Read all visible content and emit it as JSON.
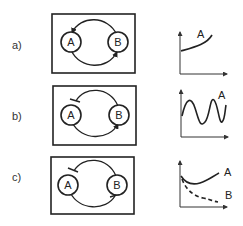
{
  "figure": {
    "rows": [
      {
        "label": "a)",
        "motif": "mutual activation (positive feedback)",
        "nodes": [
          "A",
          "B"
        ],
        "edges": [
          {
            "from": "B",
            "to": "A",
            "type": "activation"
          },
          {
            "from": "A",
            "to": "B",
            "type": "activation"
          }
        ],
        "plot": {
          "curves": [
            {
              "label": "A",
              "shape": "increasing exponential",
              "style": "solid"
            }
          ]
        }
      },
      {
        "label": "b)",
        "motif": "negative feedback loop",
        "nodes": [
          "A",
          "B"
        ],
        "edges": [
          {
            "from": "B",
            "to": "A",
            "type": "inhibition"
          },
          {
            "from": "A",
            "to": "B",
            "type": "activation"
          }
        ],
        "plot": {
          "curves": [
            {
              "label": "A",
              "shape": "oscillation",
              "style": "solid"
            }
          ]
        }
      },
      {
        "label": "c)",
        "motif": "mutual inhibition",
        "nodes": [
          "A",
          "B"
        ],
        "edges": [
          {
            "from": "B",
            "to": "A",
            "type": "inhibition"
          },
          {
            "from": "A",
            "to": "B",
            "type": "inhibition"
          }
        ],
        "plot": {
          "curves": [
            {
              "label": "A",
              "shape": "dip then rise",
              "style": "solid"
            },
            {
              "label": "B",
              "shape": "decay",
              "style": "dashed"
            }
          ]
        }
      }
    ]
  },
  "colors": {
    "line": "#222222",
    "background": "#ffffff"
  }
}
